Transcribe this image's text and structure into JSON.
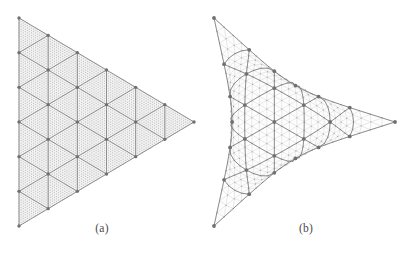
{
  "figure": {
    "background_color": "#ffffff",
    "panels": [
      {
        "id": "a",
        "caption": "(a)",
        "description": "Uniform equilateral-triangle reference mesh",
        "shape": "straight-sided triangle",
        "coarse_divisions": 6,
        "fine_subdivisions": 14,
        "edge_curvature": 0.0,
        "corners": [
          {
            "x": 19,
            "y": 18
          },
          {
            "x": 194,
            "y": 122
          },
          {
            "x": 19,
            "y": 226
          }
        ],
        "colors": {
          "coarse_edge": "#6f6f6f",
          "fine_edge": "#cfcfcf",
          "fine_dot": "#9a9a9a",
          "coarse_node": "#707070",
          "fill": "#fbfbfb"
        },
        "line_widths": {
          "coarse": 0.75,
          "fine": 0.28
        },
        "node_radius": {
          "coarse": 1.7,
          "fine": 0.38
        }
      },
      {
        "id": "b",
        "caption": "(b)",
        "description": "Deformed mesh with concave cusped edges",
        "shape": "concave curved triangle with cusps",
        "coarse_divisions": 6,
        "fine_subdivisions": 4,
        "edge_curvature": 0.3,
        "corners": [
          {
            "x": 10,
            "y": 18
          },
          {
            "x": 191,
            "y": 122
          },
          {
            "x": 10,
            "y": 226
          }
        ],
        "colors": {
          "coarse_edge": "#6f6f6f",
          "fine_edge": "#b8b8b8",
          "fine_dot": "#9a9a9a",
          "coarse_node": "#707070",
          "fill": "#fdfdfd"
        },
        "line_widths": {
          "coarse": 0.75,
          "fine": 0.3
        },
        "node_radius": {
          "coarse": 1.9,
          "fine": 0.55
        }
      }
    ]
  },
  "chart_data": {
    "type": "diagram",
    "title": "",
    "subtitle": "",
    "panel_labels": [
      "(a)",
      "(b)"
    ]
  }
}
